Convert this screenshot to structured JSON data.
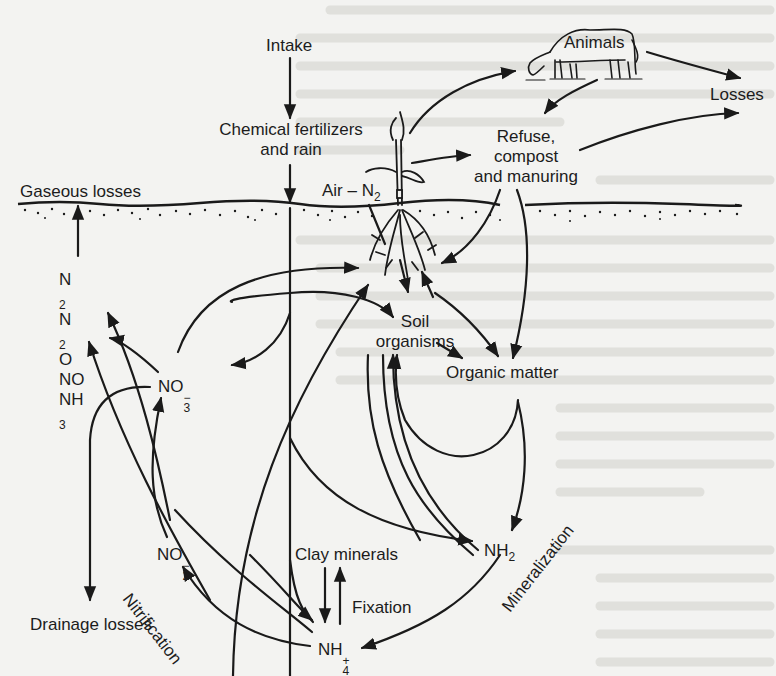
{
  "figure": {
    "nodes": {
      "intake": "Intake",
      "chemical_fertilizers": [
        "Chemical fertilizers",
        "and rain"
      ],
      "animals": "Animals",
      "losses": "Losses",
      "refuse": [
        "Refuse,",
        "compost",
        "and manuring"
      ],
      "gaseous_losses": "Gaseous losses",
      "air_n2": {
        "text": "Air – N",
        "sub": "2"
      },
      "gases": [
        {
          "base": "N",
          "sub": "2",
          "tail": ""
        },
        {
          "base": "N",
          "sub": "2",
          "tail": "O"
        },
        {
          "base": "NO",
          "sub": "",
          "tail": ""
        },
        {
          "base": "NH",
          "sub": "3",
          "tail": ""
        }
      ],
      "soil_organisms": [
        "Soil",
        "organisms"
      ],
      "organic_matter": "Organic matter",
      "no3": {
        "base": "NO",
        "sub": "3",
        "sup": "−"
      },
      "no2": {
        "base": "NO",
        "sub": "2",
        "sup": "−"
      },
      "nh2": {
        "base": "NH",
        "sub": "2"
      },
      "nh4": {
        "base": "NH",
        "sub": "4",
        "sup": "+"
      },
      "clay_minerals": "Clay minerals",
      "fixation": "Fixation",
      "drainage_losses": "Drainage losses"
    },
    "process_labels": {
      "nitrification": "Nitrification",
      "mineralization": "Mineralization"
    },
    "icons": [
      "cow-illustration",
      "plant-with-roots-illustration",
      "soil-surface-line"
    ],
    "colors": {
      "ink": "#1a1a1a",
      "paper": "#f3f3f1",
      "bleed": "#d9d9d6"
    }
  }
}
